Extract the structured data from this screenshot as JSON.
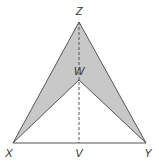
{
  "diagram": {
    "points": {
      "Z": {
        "label": "Z",
        "x": 79,
        "y": 22
      },
      "W": {
        "label": "W",
        "x": 79,
        "y": 80
      },
      "X": {
        "label": "X",
        "x": 13,
        "y": 143
      },
      "Y": {
        "label": "Y",
        "x": 146,
        "y": 143
      },
      "V": {
        "label": "V",
        "x": 79,
        "y": 143
      }
    },
    "shaded_region": "XZYW",
    "dashed_segment": "ZV",
    "solid_segments": [
      "XZ",
      "ZY",
      "XW",
      "WY",
      "XY"
    ],
    "colors": {
      "fill": "#c8c8c8",
      "stroke": "#555555",
      "label": "#333333",
      "background": "#ffffff"
    }
  }
}
